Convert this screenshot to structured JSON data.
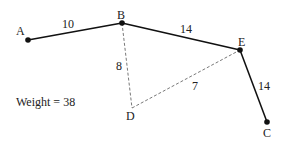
{
  "diagram": {
    "nodes": [
      {
        "id": "A",
        "label": "A",
        "x": 28,
        "y": 40
      },
      {
        "id": "B",
        "label": "B",
        "x": 122,
        "y": 23
      },
      {
        "id": "E",
        "label": "E",
        "x": 240,
        "y": 50
      },
      {
        "id": "C",
        "label": "C",
        "x": 267,
        "y": 122
      },
      {
        "id": "D",
        "label": "D",
        "x": 132,
        "y": 108
      }
    ],
    "edges": [
      {
        "from": "A",
        "to": "B",
        "weight": "10",
        "style": "solid"
      },
      {
        "from": "B",
        "to": "E",
        "weight": "14",
        "style": "solid"
      },
      {
        "from": "E",
        "to": "C",
        "weight": "14",
        "style": "solid"
      },
      {
        "from": "B",
        "to": "D",
        "weight": "8",
        "style": "dashed"
      },
      {
        "from": "D",
        "to": "E",
        "weight": "7",
        "style": "dashed"
      }
    ],
    "weight_text": "Weight = 38"
  }
}
